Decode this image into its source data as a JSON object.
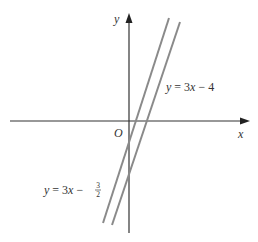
{
  "figure": {
    "axes": {
      "x_label": "x",
      "y_label": "y",
      "origin_label": "O"
    },
    "lines": [
      {
        "equation_lhs": "y = 3x − ",
        "equation_const": "4",
        "full": "y = 3x − 4",
        "slope": 3,
        "intercept": -4
      },
      {
        "equation_lhs": "y = 3x − ",
        "frac_num": "3",
        "frac_den": "2",
        "full": "y = 3x − 3/2",
        "slope": 3,
        "intercept": -1.5
      }
    ],
    "colors": {
      "axis": "#333333",
      "line": "#8a8a8a"
    }
  }
}
